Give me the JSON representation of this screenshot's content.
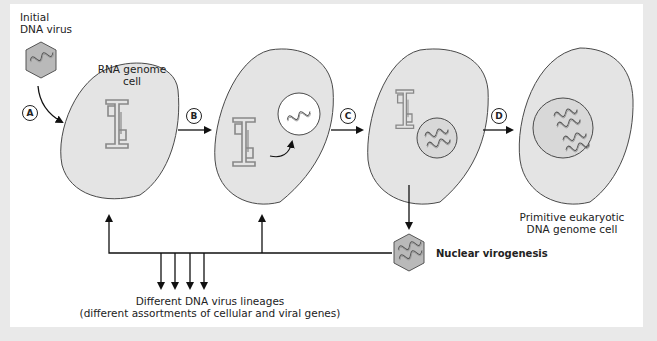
{
  "diagram": {
    "type": "process-flow",
    "colors": {
      "cell_fill": "#e4e4e4",
      "cell_stroke": "#4a4a4a",
      "virus_fill": "#b9b9b9",
      "nucleus_fill": "#d8d8d8",
      "arrow": "#111111",
      "background": "#ffffff"
    },
    "labels": {
      "initial_virus_line1": "Initial",
      "initial_virus_line2": "DNA virus",
      "rna_cell_line1": "RNA genome",
      "rna_cell_line2": "cell",
      "final_cell_line1": "Primitive eukaryotic",
      "final_cell_line2": "DNA genome cell",
      "nuclear_virogenesis": "Nuclear virogenesis",
      "lineages_line1": "Different DNA virus lineages",
      "lineages_line2": "(different assortments of cellular and viral genes)"
    },
    "steps": [
      "A",
      "B",
      "C",
      "D"
    ],
    "nodes": [
      {
        "id": "initial-dna-virus",
        "label": "Initial DNA virus",
        "shape": "hexagon"
      },
      {
        "id": "cell-1",
        "label": "RNA genome cell",
        "contents": [
          "RNA structure"
        ]
      },
      {
        "id": "cell-2",
        "contents": [
          "RNA structure",
          "vesicle with DNA"
        ]
      },
      {
        "id": "cell-3",
        "contents": [
          "RNA structure",
          "nucleus with 2 DNA strands"
        ]
      },
      {
        "id": "cell-4",
        "label": "Primitive eukaryotic DNA genome cell",
        "contents": [
          "nucleus with 4 DNA strands"
        ]
      },
      {
        "id": "nuclear-virus",
        "label": "Nuclear virogenesis",
        "shape": "hexagon"
      }
    ],
    "edges": [
      {
        "from": "initial-dna-virus",
        "to": "cell-1",
        "step": "A"
      },
      {
        "from": "cell-1",
        "to": "cell-2",
        "step": "B"
      },
      {
        "from": "cell-2",
        "to": "cell-3",
        "step": "C"
      },
      {
        "from": "cell-3",
        "to": "cell-4",
        "step": "D"
      },
      {
        "from": "cell-3",
        "to": "nuclear-virus"
      },
      {
        "from": "nuclear-virus",
        "to": "cell-1"
      },
      {
        "from": "nuclear-virus",
        "to": "cell-2"
      },
      {
        "from": "nuclear-virus",
        "to": "different-dna-virus-lineages",
        "count": 4
      }
    ]
  }
}
